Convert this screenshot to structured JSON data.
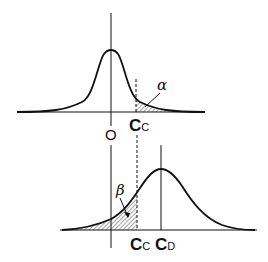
{
  "diagram": {
    "type": "statistical hypothesis test distributions",
    "top_panel": {
      "curve": "null distribution centered at O",
      "origin_label": "O",
      "critical_label": {
        "main": "C",
        "sub": "C"
      },
      "tail_area_label": "α",
      "shaded_region": "right tail beyond C_C"
    },
    "bottom_panel": {
      "curve": "alternative distribution centered at C_D",
      "critical_label": {
        "main": "C",
        "sub": "C"
      },
      "mean_label": {
        "main": "C",
        "sub": "D"
      },
      "tail_area_label": "β",
      "shaded_region": "left tail below C_C"
    },
    "colors": {
      "line": "#111111",
      "background": "#ffffff"
    }
  }
}
